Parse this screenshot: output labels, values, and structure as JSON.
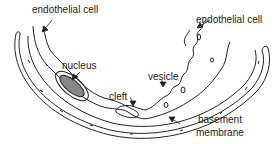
{
  "diagram": {
    "labels": {
      "endothelial_cell_left": "endothelial cell",
      "endothelial_cell_right": "endothelial cell",
      "nucleus": "nucleus",
      "vesicle": "vesicle",
      "cleft": "cleft",
      "basement_membrane_line1": "basement",
      "basement_membrane_line2": "membrane"
    },
    "colors": {
      "stroke": "#222222",
      "background": "#ffffff",
      "nucleus_fill": "#888888"
    }
  }
}
